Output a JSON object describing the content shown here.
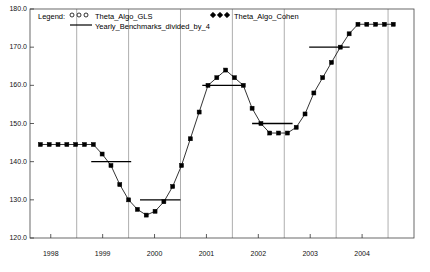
{
  "chart_data": {
    "type": "line",
    "title": "",
    "xlabel": "",
    "ylabel": "",
    "xlim": [
      1997.6,
      2005.0
    ],
    "ylim": [
      120.0,
      180.0
    ],
    "grid": "vertical",
    "legend_position": "top-inside",
    "y_ticks": [
      "180.0",
      "170.0",
      "160.0",
      "150.0",
      "140.0",
      "130.0",
      "120.0"
    ],
    "y_tick_values": [
      180.0,
      170.0,
      160.0,
      150.0,
      140.0,
      130.0,
      120.0
    ],
    "x_ticks": [
      "1998",
      "1999",
      "2000",
      "2001",
      "2002",
      "2003",
      "2004"
    ],
    "x_tick_values": [
      1998,
      1999,
      2000,
      2001,
      2002,
      2003,
      2004
    ],
    "series": [
      {
        "name": "Theta_Algo_GLS",
        "marker": "open-circle-line",
        "color": "#000000",
        "values": []
      },
      {
        "name": "Theta_Algo_Cohen",
        "marker": "filled-square-line",
        "color": "#000000",
        "x": [
          1997.8,
          1997.97,
          1998.14,
          1998.31,
          1998.48,
          1998.65,
          1998.82,
          1998.99,
          1999.16,
          1999.33,
          1999.5,
          1999.67,
          1999.84,
          2000.01,
          2000.18,
          2000.35,
          2000.52,
          2000.69,
          2000.86,
          2001.03,
          2001.2,
          2001.37,
          2001.54,
          2001.71,
          2001.88,
          2002.05,
          2002.22,
          2002.39,
          2002.56,
          2002.73,
          2002.9,
          2003.07,
          2003.24,
          2003.41,
          2003.58,
          2003.75,
          2003.92,
          2004.09,
          2004.26,
          2004.43,
          2004.6
        ],
        "values": [
          144.5,
          144.5,
          144.5,
          144.5,
          144.5,
          144.5,
          144.5,
          142.0,
          139.0,
          134.0,
          130.0,
          127.5,
          126.0,
          127.0,
          129.5,
          133.5,
          139.0,
          146.0,
          153.0,
          160.0,
          162.0,
          164.0,
          162.0,
          160.0,
          154.0,
          150.0,
          147.5,
          147.5,
          147.5,
          149.0,
          152.5,
          158.0,
          162.0,
          166.0,
          170.0,
          173.5,
          176.0,
          176.0,
          176.0,
          176.0,
          176.0
        ]
      }
    ],
    "benchmarks": {
      "name": "Yearly_Benchmarks_divided_by_4",
      "style": "horizontal-step-bars",
      "color": "#000000",
      "bars": [
        {
          "year": 1999,
          "value": 140.0,
          "x_start": 1998.78,
          "x_end": 1999.55
        },
        {
          "year": 2000,
          "value": 130.0,
          "x_start": 1999.72,
          "x_end": 2000.5
        },
        {
          "year": 2001,
          "value": 160.0,
          "x_start": 2000.92,
          "x_end": 2001.7
        },
        {
          "year": 2002,
          "value": 150.0,
          "x_start": 2001.88,
          "x_end": 2002.66
        },
        {
          "year": 2003,
          "value": 170.0,
          "x_start": 2002.98,
          "x_end": 2003.76
        }
      ]
    },
    "legend": {
      "title_label": "Legend:",
      "entries": [
        {
          "label": "Theta_Algo_GLS",
          "marker": "open-circle"
        },
        {
          "label": "Yearly_Benchmarks_divided_by_4",
          "marker": "solid-line"
        },
        {
          "label": "Theta_Algo_Cohen",
          "marker": "filled-diamond"
        }
      ]
    }
  }
}
